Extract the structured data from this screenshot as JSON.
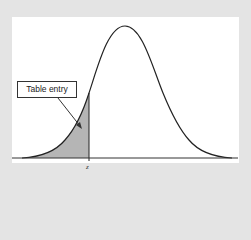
{
  "diagram": {
    "callout_label": "Table entry",
    "x_marker_label": "z",
    "colors": {
      "background": "#e4e4e4",
      "panel": "#ffffff",
      "curve": "#222222",
      "shaded_area": "#b5b5b5",
      "baseline": "#333333"
    }
  }
}
